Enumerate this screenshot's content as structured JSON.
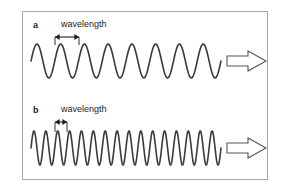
{
  "figure": {
    "background_color": "#ffffff",
    "border_color": "#a8a8a8",
    "wave_color": "#3a3a3a",
    "annotation_color": "#1c1c1c",
    "arrow_outline_color": "#555555"
  },
  "panels": [
    {
      "id": "a",
      "label": "a",
      "wavelength_label": "wavelength",
      "wave": {
        "cycles": 8,
        "amplitude": 17,
        "baseline_y": 49,
        "start_x": 8,
        "end_x": 198,
        "stroke_width": 1.6
      },
      "measure": {
        "from_x": 32,
        "to_x": 56,
        "arrow_y": 25,
        "tick_top_y": 25,
        "tick_bottom_y": 33
      },
      "direction_arrow": {
        "label": "direction of travel",
        "points_to": "right"
      }
    },
    {
      "id": "b",
      "label": "b",
      "wavelength_label": "wavelength",
      "wave": {
        "cycles": 16,
        "amplitude": 17,
        "baseline_y": 51,
        "start_x": 8,
        "end_x": 198,
        "stroke_width": 1.6
      },
      "measure": {
        "from_x": 32,
        "to_x": 44,
        "arrow_y": 25,
        "tick_top_y": 25,
        "tick_bottom_y": 35
      },
      "direction_arrow": {
        "label": "direction of travel",
        "points_to": "right"
      }
    }
  ]
}
